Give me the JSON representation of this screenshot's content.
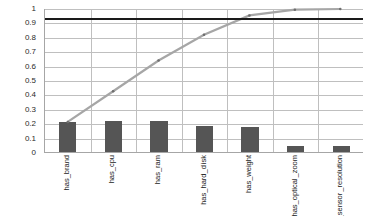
{
  "chart_data": {
    "type": "bar",
    "title": "",
    "subtitle": "",
    "xlabel": "",
    "ylabel": "",
    "categories": [
      "has_brand",
      "has_cpu",
      "has_ram",
      "has_hard_disk",
      "has_weight",
      "has_optical_zoom",
      "has_sensor_resolution"
    ],
    "category_label_lines": [
      [
        "has_brand"
      ],
      [
        "has_cpu"
      ],
      [
        "has_ram"
      ],
      [
        "has_hard_d",
        "isk"
      ],
      [
        "has_weight"
      ],
      [
        "has_optical",
        "_zoom"
      ],
      [
        "has_sensor",
        "_resolution"
      ]
    ],
    "series": [
      {
        "name": "frequency",
        "render": "bar",
        "color": "#555555",
        "values": [
          0.21,
          0.215,
          0.215,
          0.18,
          0.175,
          0.04,
          0.045
        ]
      },
      {
        "name": "cumulative",
        "render": "line",
        "color": "#a6a6a6",
        "values": [
          0.21,
          0.425,
          0.64,
          0.82,
          0.955,
          0.995,
          1.0
        ]
      },
      {
        "name": "threshold",
        "render": "line",
        "color": "#1a1a1a",
        "values": [
          0.93,
          0.93,
          0.93,
          0.93,
          0.93,
          0.93,
          0.93
        ]
      }
    ],
    "ylim": [
      0,
      1
    ],
    "ytick_values": [
      0,
      0.1,
      0.2,
      0.3,
      0.4,
      0.5,
      0.6,
      0.7,
      0.8,
      0.9,
      1
    ],
    "ytick_labels": [
      "0",
      "0.1",
      "0.2",
      "0.3",
      "0.4",
      "0.5",
      "0.6",
      "0.7",
      "0.8",
      "0.9",
      "1"
    ],
    "grid": {
      "horizontal": true,
      "vertical": true,
      "color": "#bfbfbf"
    },
    "legend": {
      "visible": false,
      "position": "none"
    },
    "axis": {
      "line_color": "#a6a6a6",
      "x_label_rotation": -90
    },
    "plot_background": "#ffffff"
  }
}
